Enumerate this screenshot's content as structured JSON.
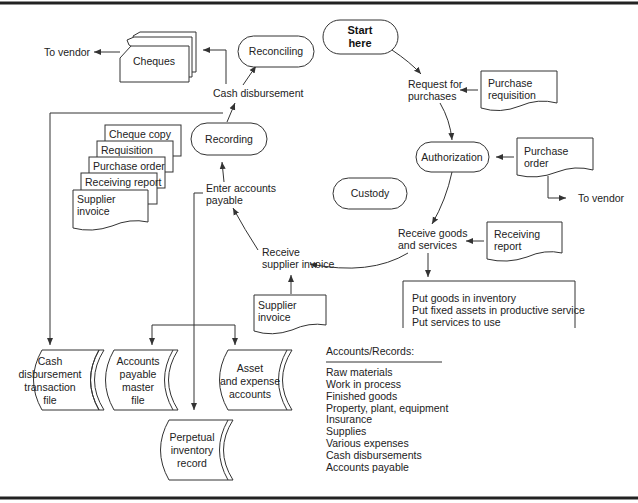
{
  "diagram": {
    "terminators": {
      "start": [
        "Start",
        "here"
      ],
      "reconciling": "Reconciling",
      "recording": "Recording",
      "authorization": "Authorization",
      "custody": "Custody"
    },
    "steps": {
      "request": [
        "Request for",
        "purchases"
      ],
      "receive_goods": [
        "Receive goods",
        "and services"
      ],
      "receive_invoice": [
        "Receive",
        "supplier invoice"
      ],
      "enter_ap": [
        "Enter accounts",
        "payable"
      ],
      "cash_disbursement": "Cash disbursement",
      "to_vendor_left": "To vendor",
      "to_vendor_right": "To vendor"
    },
    "documents": {
      "cheques": "Cheques",
      "purchase_requisition": [
        "Purchase",
        "requisition"
      ],
      "purchase_order": [
        "Purchase",
        "order"
      ],
      "receiving_report": [
        "Receiving",
        "report"
      ],
      "supplier_invoice": [
        "Supplier",
        "invoice"
      ],
      "stack": [
        "Cheque copy",
        "Requisition",
        "Purchase order",
        "Receiving report"
      ],
      "stack_bottom": [
        "Supplier",
        "invoice"
      ]
    },
    "actions_box": [
      "Put goods in inventory",
      "Put fixed assets in productive service",
      "Put services to use"
    ],
    "files": {
      "cash_disbursement_file": [
        "Cash",
        "disbursement",
        "transaction",
        "file"
      ],
      "ap_master_file": [
        "Accounts",
        "payable",
        "master",
        "file"
      ],
      "asset_expense": [
        "Asset",
        "and expense",
        "accounts"
      ],
      "perpetual_inventory": [
        "Perpetual",
        "inventory",
        "record"
      ]
    },
    "accounts_records": {
      "heading": "Accounts/Records:",
      "items": [
        "Raw materials",
        "Work in process",
        "Finished goods",
        "Property, plant, equipment",
        "Insurance",
        "Supplies",
        "Various expenses",
        "Cash disbursements",
        "Accounts payable"
      ]
    }
  }
}
